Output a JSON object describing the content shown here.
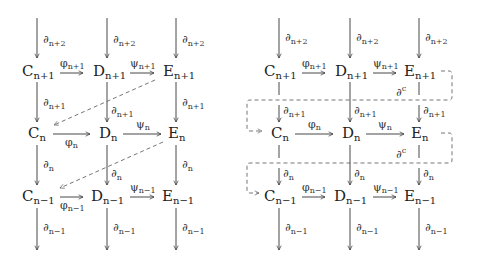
{
  "figure": {
    "panels": [
      {
        "id": "left",
        "description": "Diagonal connecting homomorphisms",
        "rows": [
          {
            "C": {
              "base": "C",
              "sub": "n+1"
            },
            "D": {
              "base": "D",
              "sub": "n+1"
            },
            "E": {
              "base": "E",
              "sub": "n+1"
            },
            "phi": {
              "base": "φ",
              "sub": "n+1"
            },
            "psi": {
              "base": "ψ",
              "sub": "n+1"
            }
          },
          {
            "C": {
              "base": "C",
              "sub": "n"
            },
            "D": {
              "base": "D",
              "sub": "n"
            },
            "E": {
              "base": "E",
              "sub": "n"
            },
            "phi": {
              "base": "φ",
              "sub": "n"
            },
            "psi": {
              "base": "ψ",
              "sub": "n"
            }
          },
          {
            "C": {
              "base": "C",
              "sub": "n−1"
            },
            "D": {
              "base": "D",
              "sub": "n−1"
            },
            "E": {
              "base": "E",
              "sub": "n−1"
            },
            "phi": {
              "base": "φ",
              "sub": "n−1"
            },
            "psi": {
              "base": "ψ",
              "sub": "n−1"
            }
          }
        ],
        "vertical_labels": [
          {
            "base": "∂",
            "sub": "n+2"
          },
          {
            "base": "∂",
            "sub": "n+1"
          },
          {
            "base": "∂",
            "sub": "n"
          },
          {
            "base": "∂",
            "sub": "n−1"
          }
        ]
      },
      {
        "id": "right",
        "description": "Snake connecting homomorphisms",
        "rows": [
          {
            "C": {
              "base": "C",
              "sub": "n+1"
            },
            "D": {
              "base": "D",
              "sub": "n+1"
            },
            "E": {
              "base": "E",
              "sub": "n+1"
            },
            "phi": {
              "base": "φ",
              "sub": "n+1"
            },
            "psi": {
              "base": "ψ",
              "sub": "n+1"
            }
          },
          {
            "C": {
              "base": "C",
              "sub": "n"
            },
            "D": {
              "base": "D",
              "sub": "n"
            },
            "E": {
              "base": "E",
              "sub": "n"
            },
            "phi": {
              "base": "φ",
              "sub": "n"
            },
            "psi": {
              "base": "ψ",
              "sub": "n"
            }
          },
          {
            "C": {
              "base": "C",
              "sub": "n−1"
            },
            "D": {
              "base": "D",
              "sub": "n−1"
            },
            "E": {
              "base": "E",
              "sub": "n−1"
            },
            "phi": {
              "base": "φ",
              "sub": "n−1"
            },
            "psi": {
              "base": "ψ",
              "sub": "n−1"
            }
          }
        ],
        "vertical_labels": [
          {
            "base": "∂",
            "sub": "n+2"
          },
          {
            "base": "∂",
            "sub": "n+1"
          },
          {
            "base": "∂",
            "sub": "n"
          },
          {
            "base": "∂",
            "sub": "n−1"
          }
        ],
        "connecting_label": {
          "base": "∂",
          "sup": "c"
        }
      }
    ]
  }
}
